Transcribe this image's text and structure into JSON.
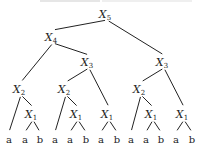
{
  "diagram": {
    "type": "tree",
    "nodes": [
      {
        "id": "n5",
        "var": "X",
        "sub": "5",
        "x": 107,
        "y": 15
      },
      {
        "id": "n4",
        "var": "X",
        "sub": "4",
        "x": 53,
        "y": 38
      },
      {
        "id": "n3a",
        "var": "X",
        "sub": "3",
        "x": 89,
        "y": 63
      },
      {
        "id": "n3b",
        "var": "X",
        "sub": "3",
        "x": 164,
        "y": 63
      },
      {
        "id": "n2a",
        "var": "X",
        "sub": "2",
        "x": 21,
        "y": 90
      },
      {
        "id": "n2b",
        "var": "X",
        "sub": "2",
        "x": 66,
        "y": 90
      },
      {
        "id": "n2c",
        "var": "X",
        "sub": "2",
        "x": 141,
        "y": 90
      },
      {
        "id": "n1a",
        "var": "X",
        "sub": "1",
        "x": 33,
        "y": 115
      },
      {
        "id": "n1b",
        "var": "X",
        "sub": "1",
        "x": 78,
        "y": 115
      },
      {
        "id": "n1c",
        "var": "X",
        "sub": "1",
        "x": 109,
        "y": 115
      },
      {
        "id": "n1d",
        "var": "X",
        "sub": "1",
        "x": 153,
        "y": 115
      },
      {
        "id": "n1e",
        "var": "X",
        "sub": "1",
        "x": 184,
        "y": 115
      }
    ],
    "leaves": [
      {
        "id": "l1",
        "label": "a",
        "x": 9,
        "y": 140
      },
      {
        "id": "l2",
        "label": "a",
        "x": 25,
        "y": 140
      },
      {
        "id": "l3",
        "label": "b",
        "x": 40,
        "y": 140
      },
      {
        "id": "l4",
        "label": "a",
        "x": 55,
        "y": 140
      },
      {
        "id": "l5",
        "label": "a",
        "x": 70,
        "y": 140
      },
      {
        "id": "l6",
        "label": "b",
        "x": 86,
        "y": 140
      },
      {
        "id": "l7",
        "label": "a",
        "x": 101,
        "y": 140
      },
      {
        "id": "l8",
        "label": "b",
        "x": 117,
        "y": 140
      },
      {
        "id": "l9",
        "label": "a",
        "x": 131,
        "y": 140
      },
      {
        "id": "l10",
        "label": "a",
        "x": 146,
        "y": 140
      },
      {
        "id": "l11",
        "label": "b",
        "x": 161,
        "y": 140
      },
      {
        "id": "l12",
        "label": "a",
        "x": 176,
        "y": 140
      },
      {
        "id": "l13",
        "label": "b",
        "x": 192,
        "y": 140
      }
    ],
    "edges": [
      [
        "n5",
        "n4"
      ],
      [
        "n5",
        "n3b"
      ],
      [
        "n4",
        "n2a"
      ],
      [
        "n4",
        "n3a"
      ],
      [
        "n3a",
        "n2b"
      ],
      [
        "n3a",
        "n1c"
      ],
      [
        "n3b",
        "n2c"
      ],
      [
        "n3b",
        "n1e"
      ],
      [
        "n2a",
        "l1"
      ],
      [
        "n2a",
        "n1a"
      ],
      [
        "n2b",
        "l4"
      ],
      [
        "n2b",
        "n1b"
      ],
      [
        "n2c",
        "l9"
      ],
      [
        "n2c",
        "n1d"
      ],
      [
        "n1a",
        "l2"
      ],
      [
        "n1a",
        "l3"
      ],
      [
        "n1b",
        "l5"
      ],
      [
        "n1b",
        "l6"
      ],
      [
        "n1c",
        "l7"
      ],
      [
        "n1c",
        "l8"
      ],
      [
        "n1d",
        "l10"
      ],
      [
        "n1d",
        "l11"
      ],
      [
        "n1e",
        "l12"
      ],
      [
        "n1e",
        "l13"
      ]
    ]
  },
  "colors": {
    "line": "#222222",
    "background": "#ffffff"
  }
}
